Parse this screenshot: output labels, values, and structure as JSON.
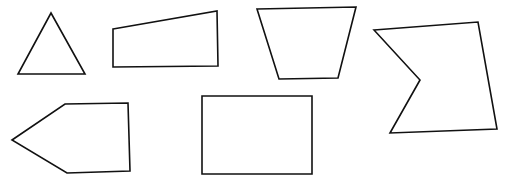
{
  "canvas": {
    "width": 509,
    "height": 186,
    "background_color": "#ffffff",
    "stroke_color": "#111111",
    "fill_color": "#ffffff",
    "stroke_width": 1.6,
    "title": "",
    "caption": ""
  },
  "figure": {
    "shape_count": 6,
    "rows": 2
  },
  "shapes": [
    {
      "id": "shape-1",
      "name": "triangle",
      "label": "Triangle",
      "sides": 3,
      "row": 1,
      "column": 1,
      "convex": true,
      "points": "51,13 85,74 18,74",
      "bbox": [
        18,
        13,
        67,
        61
      ]
    },
    {
      "id": "shape-2",
      "name": "right-trapezoid",
      "label": "Trapezoid",
      "sides": 4,
      "row": 1,
      "column": 2,
      "convex": true,
      "points": "113,29 217,11 218,66 113,67",
      "bbox": [
        113,
        11,
        105,
        56
      ]
    },
    {
      "id": "shape-3",
      "name": "inverted-trapezoid",
      "label": "Inverted trapezoid",
      "sides": 4,
      "row": 1,
      "column": 3,
      "convex": true,
      "points": "257,9 356,7 338,78 279,79",
      "bbox": [
        257,
        7,
        99,
        72
      ]
    },
    {
      "id": "shape-4",
      "name": "concave-arrow-polygon",
      "label": "Concave pentagon",
      "sides": 5,
      "row": 1,
      "column": 4,
      "convex": false,
      "points": "374,30 478,22 497,129 390,133 420,80",
      "bbox": [
        374,
        22,
        123,
        111
      ]
    },
    {
      "id": "shape-5",
      "name": "left-pointing-pentagon",
      "label": "Pentagon",
      "sides": 5,
      "row": 2,
      "column": 1,
      "convex": true,
      "points": "12,140 65,104 128,103 130,171 67,173",
      "bbox": [
        12,
        103,
        118,
        70
      ]
    },
    {
      "id": "shape-6",
      "name": "rectangle",
      "label": "Rectangle",
      "sides": 4,
      "row": 2,
      "column": 2,
      "convex": true,
      "points": "202,96 312,96 312,174 202,174",
      "bbox": [
        202,
        96,
        110,
        78
      ]
    }
  ]
}
